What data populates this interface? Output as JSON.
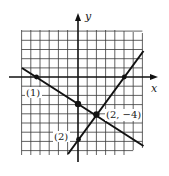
{
  "figure": {
    "axes": {
      "x_label": "x",
      "y_label": "y"
    },
    "lines": [
      {
        "id": "line-1",
        "label": "(1)",
        "slope_est": -0.6,
        "x_intercept_est": -4.67,
        "y_intercept_est": -2.8
      },
      {
        "id": "line-2",
        "label": "(2)",
        "slope_est": 1.333,
        "x_intercept_est": 5,
        "y_intercept_est": -6.67
      }
    ],
    "intersection": {
      "label": "(2, −4)",
      "x": 2,
      "y": -4
    },
    "colors": {
      "ink": "#1a1a1a",
      "grid": "#3a3a3a",
      "background": "#ffffff"
    }
  }
}
